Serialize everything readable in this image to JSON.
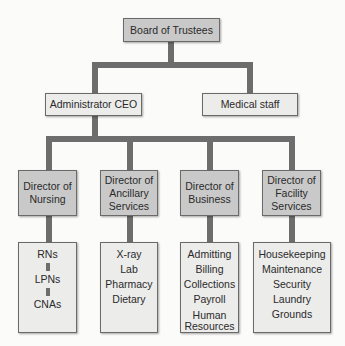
{
  "diagram": {
    "type": "org-chart",
    "colors": {
      "connector": "#6d6d6d",
      "box_dark": "#c9c9c9",
      "box_light": "#ececeb",
      "border": "#6a6a6a"
    },
    "root": {
      "label": "Board of Trustees"
    },
    "level1": [
      {
        "label": "Administrator CEO"
      },
      {
        "label": "Medical staff"
      }
    ],
    "directors": [
      {
        "label": "Director of Nursing",
        "lines": [
          "Director of",
          "Nursing"
        ]
      },
      {
        "label": "Director of Ancillary Services",
        "lines": [
          "Director of",
          "Ancillary",
          "Services"
        ]
      },
      {
        "label": "Director of Business",
        "lines": [
          "Director of",
          "Business"
        ]
      },
      {
        "label": "Director of Facility Services",
        "lines": [
          "Director of",
          "Facility",
          "Services"
        ]
      }
    ],
    "departments": [
      {
        "items": [
          "RNs",
          "LPNs",
          "CNAs"
        ],
        "hierarchical": true
      },
      {
        "items": [
          "X-ray",
          "Lab",
          "Pharmacy",
          "Dietary"
        ]
      },
      {
        "items": [
          "Admitting",
          "Billing",
          "Collections",
          "Payroll",
          "Human",
          "Resources"
        ]
      },
      {
        "items": [
          "Housekeeping",
          "Maintenance",
          "Security",
          "Laundry",
          "Grounds"
        ]
      }
    ]
  }
}
